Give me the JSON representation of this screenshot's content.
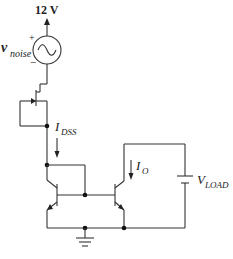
{
  "diagram": {
    "type": "circuit-schematic",
    "supply": {
      "label": "12 V"
    },
    "noise_source": {
      "symbol": "v",
      "subscript": "noise",
      "plus": "+",
      "minus": "−"
    },
    "currents": {
      "jfet": {
        "symbol": "I",
        "subscript": "DSS"
      },
      "output": {
        "symbol": "I",
        "subscript": "O"
      }
    },
    "load": {
      "symbol": "V",
      "subscript": "LOAD"
    },
    "components": [
      "12 V supply",
      "AC noise source",
      "JFET (gate tied to source)",
      "NPN Q1 (diode-connected)",
      "NPN Q2",
      "Load voltage source",
      "Ground"
    ],
    "colors": {
      "wire": "#333333",
      "background": "#ffffff"
    }
  }
}
